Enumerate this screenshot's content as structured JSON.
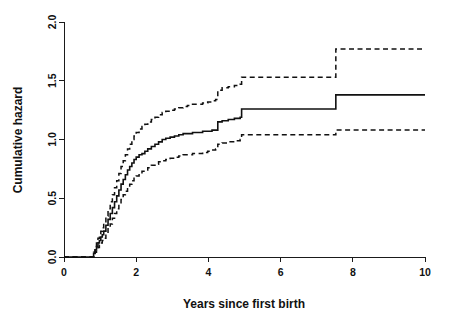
{
  "chart_data": {
    "type": "line",
    "title": "",
    "subtitle": "",
    "xlabel": "Years since first birth",
    "ylabel": "Cumulative hazard",
    "xlim": [
      0,
      10
    ],
    "ylim": [
      0,
      2.0
    ],
    "xticks": [
      0,
      2,
      4,
      6,
      8,
      10
    ],
    "xticklabels": [
      "0",
      "2",
      "4",
      "6",
      "8",
      "10"
    ],
    "yticks": [
      0.0,
      0.5,
      1.0,
      1.5,
      2.0
    ],
    "yticklabels": [
      "0.0",
      "0.5",
      "1.0",
      "1.5",
      "2.0"
    ],
    "grid": false,
    "legend": null,
    "annotations": [],
    "step_type": "post",
    "series": [
      {
        "name": "Cumulative hazard estimate",
        "style": "solid",
        "color": "#111111",
        "x": [
          0.0,
          0.78,
          0.82,
          0.86,
          0.9,
          0.94,
          0.98,
          1.02,
          1.06,
          1.1,
          1.16,
          1.22,
          1.28,
          1.34,
          1.4,
          1.46,
          1.52,
          1.58,
          1.64,
          1.7,
          1.76,
          1.82,
          1.88,
          1.94,
          2.0,
          2.08,
          2.16,
          2.24,
          2.32,
          2.42,
          2.52,
          2.62,
          2.72,
          2.82,
          2.94,
          3.06,
          3.18,
          3.3,
          3.42,
          3.56,
          3.7,
          3.84,
          3.98,
          4.1,
          4.2,
          4.26,
          4.38,
          4.55,
          4.72,
          4.88,
          4.92,
          7.53,
          10.0
        ],
        "y": [
          0.0,
          0.0,
          0.03,
          0.06,
          0.09,
          0.12,
          0.14,
          0.17,
          0.19,
          0.22,
          0.27,
          0.32,
          0.37,
          0.42,
          0.47,
          0.52,
          0.57,
          0.62,
          0.66,
          0.7,
          0.74,
          0.77,
          0.8,
          0.83,
          0.85,
          0.87,
          0.88,
          0.9,
          0.92,
          0.94,
          0.96,
          0.98,
          1.0,
          1.01,
          1.02,
          1.03,
          1.04,
          1.05,
          1.05,
          1.06,
          1.06,
          1.07,
          1.07,
          1.08,
          1.08,
          1.15,
          1.16,
          1.17,
          1.18,
          1.19,
          1.26,
          1.38,
          1.38
        ]
      },
      {
        "name": "Upper 95% confidence limit",
        "style": "dashed",
        "color": "#111111",
        "x": [
          0.0,
          0.78,
          0.82,
          0.86,
          0.9,
          0.94,
          0.98,
          1.02,
          1.06,
          1.1,
          1.16,
          1.22,
          1.28,
          1.34,
          1.4,
          1.46,
          1.52,
          1.58,
          1.64,
          1.7,
          1.76,
          1.82,
          1.88,
          1.94,
          2.0,
          2.08,
          2.16,
          2.24,
          2.32,
          2.42,
          2.52,
          2.62,
          2.72,
          2.82,
          2.94,
          3.06,
          3.18,
          3.3,
          3.42,
          3.56,
          3.7,
          3.84,
          3.98,
          4.1,
          4.2,
          4.26,
          4.38,
          4.55,
          4.72,
          4.88,
          4.92,
          7.53,
          10.0
        ],
        "y": [
          0.0,
          0.0,
          0.04,
          0.08,
          0.12,
          0.16,
          0.19,
          0.22,
          0.25,
          0.29,
          0.35,
          0.41,
          0.47,
          0.53,
          0.59,
          0.65,
          0.71,
          0.77,
          0.82,
          0.87,
          0.92,
          0.96,
          1.0,
          1.03,
          1.06,
          1.09,
          1.11,
          1.13,
          1.15,
          1.17,
          1.19,
          1.21,
          1.23,
          1.24,
          1.25,
          1.26,
          1.27,
          1.28,
          1.29,
          1.3,
          1.3,
          1.31,
          1.32,
          1.33,
          1.34,
          1.42,
          1.44,
          1.45,
          1.46,
          1.47,
          1.53,
          1.77,
          1.77
        ]
      },
      {
        "name": "Lower 95% confidence limit",
        "style": "dashed",
        "color": "#111111",
        "x": [
          0.0,
          0.78,
          0.82,
          0.86,
          0.9,
          0.94,
          0.98,
          1.02,
          1.06,
          1.1,
          1.16,
          1.22,
          1.28,
          1.34,
          1.4,
          1.46,
          1.52,
          1.58,
          1.64,
          1.7,
          1.76,
          1.82,
          1.88,
          1.94,
          2.0,
          2.08,
          2.16,
          2.24,
          2.32,
          2.42,
          2.52,
          2.62,
          2.72,
          2.82,
          2.94,
          3.06,
          3.18,
          3.3,
          3.42,
          3.56,
          3.7,
          3.84,
          3.98,
          4.1,
          4.2,
          4.26,
          4.38,
          4.55,
          4.72,
          4.88,
          4.92,
          7.53,
          10.0
        ],
        "y": [
          0.0,
          0.0,
          0.02,
          0.04,
          0.06,
          0.08,
          0.1,
          0.12,
          0.14,
          0.16,
          0.2,
          0.24,
          0.28,
          0.33,
          0.37,
          0.41,
          0.45,
          0.49,
          0.53,
          0.56,
          0.59,
          0.62,
          0.65,
          0.67,
          0.69,
          0.71,
          0.73,
          0.74,
          0.76,
          0.78,
          0.79,
          0.81,
          0.82,
          0.83,
          0.84,
          0.85,
          0.86,
          0.87,
          0.87,
          0.88,
          0.88,
          0.89,
          0.9,
          0.91,
          0.92,
          0.96,
          0.97,
          0.98,
          0.99,
          1.0,
          1.04,
          1.08,
          1.08
        ]
      }
    ]
  },
  "axes": {
    "x_title": "Years since first birth",
    "y_title": "Cumulative hazard"
  }
}
